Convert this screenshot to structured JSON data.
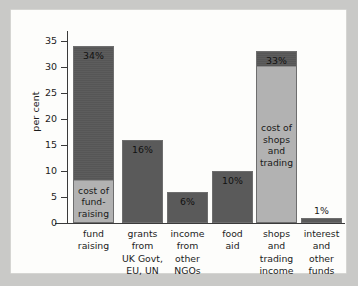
{
  "figure": {
    "background_color": "#fdfdfb",
    "page_color": "#c9c9c7",
    "bar_color": "#5a5a5a",
    "segment_color": "#b2b2b2",
    "axis_color": "#3a3a3a"
  },
  "chart_data": {
    "type": "bar",
    "title": "",
    "xlabel": "",
    "ylabel": "per cent",
    "ylim": [
      0,
      35
    ],
    "yticks": [
      0,
      5,
      10,
      15,
      20,
      25,
      30,
      35
    ],
    "ytick_labels": [
      "0",
      "5",
      "10",
      "15",
      "20",
      "25",
      "30",
      "35"
    ],
    "grid": false,
    "legend": null,
    "categories": [
      "fund raising",
      "grants from UK Govt, EU, UN",
      "income from other NGOs",
      "food aid",
      "shops and trading income",
      "interest and other funds"
    ],
    "category_label_lines": [
      [
        "fund",
        "raising"
      ],
      [
        "grants",
        "from",
        "UK Govt,",
        "EU, UN"
      ],
      [
        "income",
        "from",
        "other",
        "NGOs"
      ],
      [
        "food",
        "aid"
      ],
      [
        "shops",
        "and",
        "trading",
        "income"
      ],
      [
        "interest",
        "and",
        "other",
        "funds"
      ]
    ],
    "values": [
      34,
      16,
      6,
      10,
      33,
      1
    ],
    "value_labels": [
      "34%",
      "16%",
      "6%",
      "10%",
      "33%",
      "1%"
    ],
    "segments": [
      {
        "category": "fund raising",
        "label": "cost of fund-raising",
        "label_lines": [
          "cost of",
          "fund-",
          "raising"
        ],
        "from": 0,
        "to": 8
      },
      {
        "category": "shops and trading income",
        "label": "cost of shops and trading",
        "label_lines": [
          "cost of",
          "shops",
          "and",
          "trading"
        ],
        "from": 0,
        "to": 30
      }
    ]
  }
}
